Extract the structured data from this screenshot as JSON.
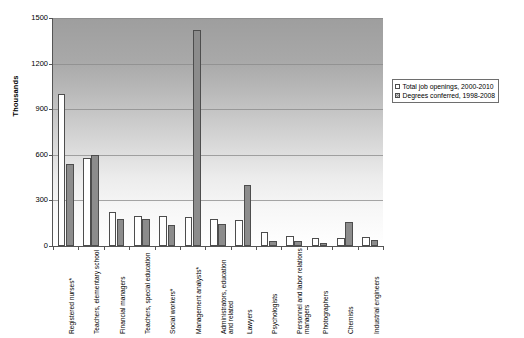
{
  "chart_data": {
    "type": "bar",
    "title": "",
    "subtitle": "",
    "xlabel": "",
    "ylabel": "Thousands",
    "ylim": [
      0,
      1500
    ],
    "yticks": [
      0,
      300,
      600,
      900,
      1200,
      1500
    ],
    "grid": true,
    "legend_position": "right",
    "categories": [
      "Registered nurses*",
      "Teachers, elementary school",
      "Financial managers",
      "Teachers, special education",
      "Social workers*",
      "Management analysts*",
      "Administrators, education and related",
      "Lawyers",
      "Psychologists",
      "Personnel and labor relations managers",
      "Photographers",
      "Chemists",
      "Industrial engineers"
    ],
    "series": [
      {
        "name": "Total job openings, 2000-2010",
        "color": "#ffffff",
        "values": [
          1000,
          580,
          225,
          200,
          195,
          190,
          180,
          170,
          90,
          65,
          50,
          55,
          60
        ]
      },
      {
        "name": "Degrees conferred, 1998-2008",
        "color": "#8c8c8c",
        "values": [
          540,
          600,
          175,
          180,
          140,
          1420,
          145,
          400,
          35,
          30,
          20,
          160,
          40
        ]
      }
    ]
  },
  "legend": {
    "items": [
      {
        "label": "Total job openings, 2000-2010",
        "swatch": "white-square-icon"
      },
      {
        "label": "Degrees conferred, 1998-2008",
        "swatch": "gray-hatched-square-icon"
      }
    ]
  },
  "axis": {
    "y_title": "Thousands",
    "y_tick_labels": [
      "1500",
      "1200",
      "900",
      "600",
      "300",
      "0"
    ]
  }
}
